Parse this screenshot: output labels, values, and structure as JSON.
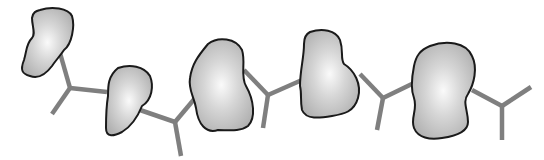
{
  "diagram": {
    "colors": {
      "background": "#ffffff",
      "connector": "#7f7f7f",
      "blob_outline": "#1a1a1a",
      "blob_fill_center": "#fafafa",
      "blob_fill_edge": "#b0b0b0"
    },
    "blobs": [
      {
        "id": "blob-1",
        "d": "M40,10 C52,6 68,8 72,16 C75,26 72,44 64,50 C60,56 56,60 52,66 C46,74 38,79 30,76 C22,74 20,70 24,60 C27,50 26,44 32,38 C36,34 32,26 32,18 C33,12 36,11 40,10 Z",
        "cx": 46,
        "cy": 43
      },
      {
        "id": "blob-2",
        "d": "M118,68 C130,64 144,66 150,76 C154,86 152,100 142,106 C138,116 132,126 122,132 C114,136 106,138 106,128 C106,118 106,108 108,96 C108,86 108,76 118,68 Z",
        "cx": 128,
        "cy": 104
      },
      {
        "id": "blob-3",
        "d": "M208,44 C218,36 236,38 242,50 C246,62 240,76 246,86 C254,100 256,118 248,126 C240,132 228,130 218,130 C206,134 198,124 196,108 C194,96 188,90 190,78 C192,64 198,56 208,44 Z",
        "cx": 222,
        "cy": 86
      },
      {
        "id": "blob-4",
        "d": "M310,32 C322,28 336,30 340,40 C344,52 340,58 344,64 C354,70 362,84 358,98 C354,112 344,114 332,116 C320,118 306,120 302,110 C300,100 302,94 300,86 C300,70 304,58 304,44 C304,38 306,34 310,32 Z",
        "cx": 330,
        "cy": 76
      },
      {
        "id": "blob-5",
        "d": "M430,46 C446,40 466,42 472,56 C478,68 474,84 468,94 C462,102 468,110 468,122 C468,132 456,136 442,138 C430,140 418,138 414,128 C410,118 418,110 414,98 C410,88 412,76 414,66 C416,56 420,50 430,46 Z",
        "cx": 442,
        "cy": 92
      }
    ],
    "connectors": [
      {
        "id": "y-1",
        "junction": [
          70,
          88
        ],
        "arms": [
          [
            60,
            53
          ],
          [
            107,
            92
          ],
          [
            52,
            114
          ]
        ]
      },
      {
        "id": "y-2",
        "junction": [
          175,
          122
        ],
        "arms": [
          [
            140,
            110
          ],
          [
            196,
            97
          ],
          [
            181,
            156
          ]
        ]
      },
      {
        "id": "y-3",
        "junction": [
          268,
          95
        ],
        "arms": [
          [
            244,
            70
          ],
          [
            302,
            80
          ],
          [
            263,
            128
          ]
        ]
      },
      {
        "id": "y-4",
        "junction": [
          383,
          98
        ],
        "arms": [
          [
            360,
            74
          ],
          [
            416,
            82
          ],
          [
            377,
            130
          ]
        ]
      },
      {
        "id": "y-5",
        "junction": [
          502,
          106
        ],
        "arms": [
          [
            472,
            90
          ],
          [
            531,
            87
          ],
          [
            502,
            140
          ]
        ]
      }
    ]
  }
}
